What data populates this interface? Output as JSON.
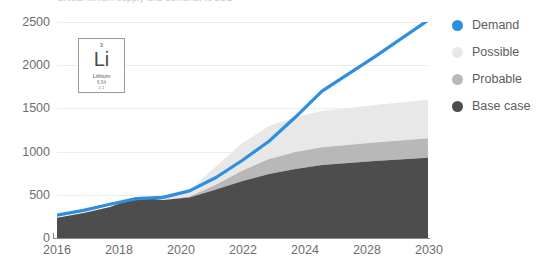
{
  "chart_data": {
    "type": "area",
    "title": "Global lithium supply and demand, kt LCE",
    "xlabel": "",
    "ylabel": "",
    "ylim": [
      0,
      2500
    ],
    "ytick_labels": [
      "0",
      "500",
      "1000",
      "1500",
      "2000",
      "2500"
    ],
    "ytick_values": [
      0,
      500,
      1000,
      1500,
      2000,
      2500
    ],
    "x": [
      2016,
      2017,
      2018,
      2019,
      2020,
      2021,
      2022,
      2023,
      2024,
      2025,
      2026,
      2028,
      2030
    ],
    "xtick_labels": [
      "2016",
      "2018",
      "2020",
      "2022",
      "2024",
      "2028",
      "2030"
    ],
    "xtick_values": [
      2016,
      2018,
      2020,
      2022,
      2024,
      2026,
      2030
    ],
    "grid": true,
    "legend_position": "right",
    "stacked": true,
    "series": [
      {
        "name": "Base case",
        "type": "area",
        "color": "#4d4d4d",
        "values": [
          235,
          290,
          360,
          475,
          440,
          470,
          560,
          660,
          740,
          800,
          845,
          890,
          930
        ]
      },
      {
        "name": "Probable",
        "type": "area",
        "color": "#b8b8b8",
        "values": [
          0,
          0,
          0,
          0,
          0,
          10,
          55,
          120,
          175,
          195,
          205,
          215,
          225
        ]
      },
      {
        "name": "Possible",
        "type": "area",
        "color": "#e8e8e8",
        "values": [
          0,
          0,
          0,
          0,
          5,
          70,
          215,
          320,
          380,
          405,
          420,
          435,
          445
        ]
      },
      {
        "name": "Demand",
        "type": "line",
        "color": "#2e8fe0",
        "values": [
          265,
          320,
          390,
          455,
          470,
          545,
          700,
          900,
          1120,
          1400,
          1700,
          2100,
          2520
        ]
      }
    ]
  },
  "legend": {
    "items": [
      {
        "label": "Demand",
        "color": "#2e8fe0"
      },
      {
        "label": "Possible",
        "color": "#e8e8e8"
      },
      {
        "label": "Probable",
        "color": "#b8b8b8"
      },
      {
        "label": "Base case",
        "color": "#4d4d4d"
      }
    ]
  },
  "element_card": {
    "atomic_number": "3",
    "symbol": "Li",
    "name": "Lithium",
    "mass": "6.94",
    "config": "2-1"
  }
}
